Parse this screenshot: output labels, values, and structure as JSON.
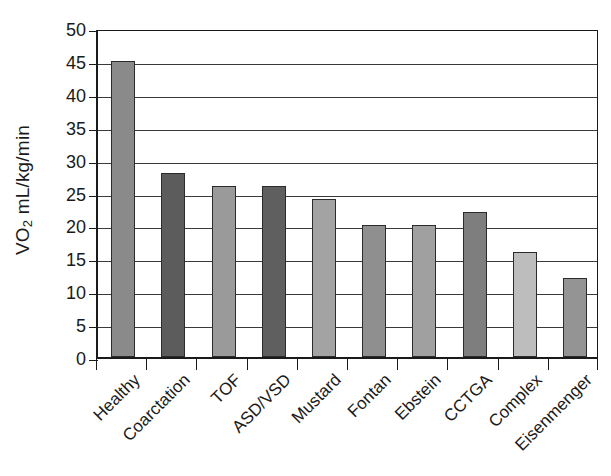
{
  "chart_data": {
    "type": "bar",
    "title": "",
    "xlabel": "",
    "ylabel": "VO2 mL/kg/min",
    "ylabel_parts": {
      "prefix": "VO",
      "subscript": "2",
      "suffix": " mL/kg/min"
    },
    "categories": [
      "Healthy",
      "Coarctation",
      "TOF",
      "ASD/VSD",
      "Mustard",
      "Fontan",
      "Ebstein",
      "CCTGA",
      "Complex",
      "Eisenmenger"
    ],
    "values": [
      45,
      28,
      26,
      26,
      24,
      20,
      20,
      22,
      16,
      12
    ],
    "bar_colors": [
      "#8a8a8a",
      "#5c5c5c",
      "#9a9a9a",
      "#5f5f5f",
      "#a3a3a3",
      "#8f8f8f",
      "#a0a0a0",
      "#7e7e7e",
      "#bdbdbd",
      "#949494"
    ],
    "ylim": [
      0,
      50
    ],
    "ytick_values": [
      0,
      5,
      10,
      15,
      20,
      25,
      30,
      35,
      40,
      45,
      50
    ],
    "ytick_labels": [
      "0",
      "5",
      "10",
      "15",
      "20",
      "25",
      "30",
      "35",
      "40",
      "45",
      "50"
    ],
    "grid": true,
    "grid_axis": "y",
    "legend": false,
    "legend_position": "none",
    "xtick_label_rotation": 45,
    "bar_outline_color": "#2b2b2b",
    "axis_color": "#1a1a1a",
    "grid_color": "#3a3a3a",
    "background_color": "#ffffff"
  }
}
